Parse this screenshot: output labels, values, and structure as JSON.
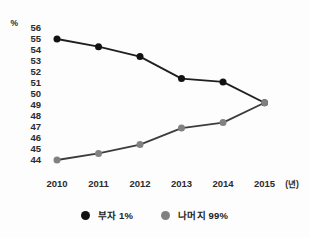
{
  "chart_data": {
    "type": "line",
    "title": "",
    "x": [
      "2010",
      "2011",
      "2012",
      "2013",
      "2014",
      "2015"
    ],
    "x_unit_label": "(년)",
    "y_unit_label": "%",
    "ylim": [
      44,
      56
    ],
    "ytick_step": 1,
    "grid": false,
    "legend_position": "bottom",
    "series": [
      {
        "name": "부자 1%",
        "values": [
          55.0,
          54.3,
          53.4,
          51.4,
          51.1,
          49.2
        ],
        "line_color": "#1f1f1f",
        "dot_color": "#121212"
      },
      {
        "name": "나머지 99%",
        "values": [
          44.0,
          44.6,
          45.4,
          46.9,
          47.4,
          49.2
        ],
        "line_color": "#3c3c3c",
        "dot_color": "#818181"
      }
    ]
  },
  "colors": {
    "background": "#fdfdfd",
    "axis_text": "#2b2b2b",
    "legend_text": "#222222"
  }
}
